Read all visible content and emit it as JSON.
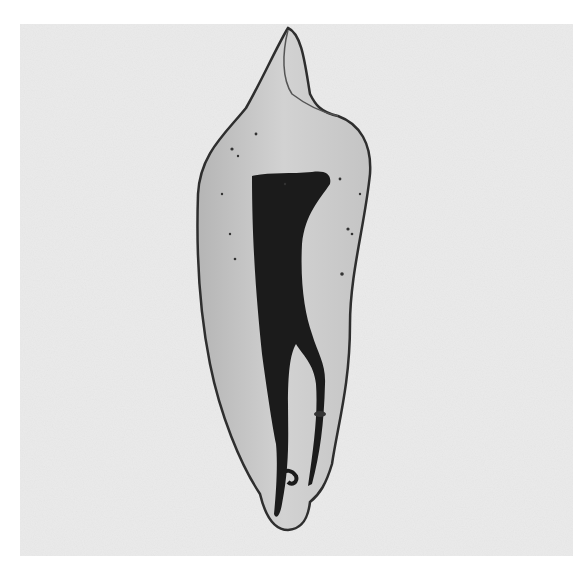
{
  "image": {
    "subject": "cleared tooth specimen with stained root canal system",
    "colors": {
      "page_background": "#ffffff",
      "photo_background": "#ebebeb",
      "dentin": "#c9c9c9",
      "enamel_outline": "#3a3a3a",
      "canal_stain": "#1a1a1a"
    }
  }
}
